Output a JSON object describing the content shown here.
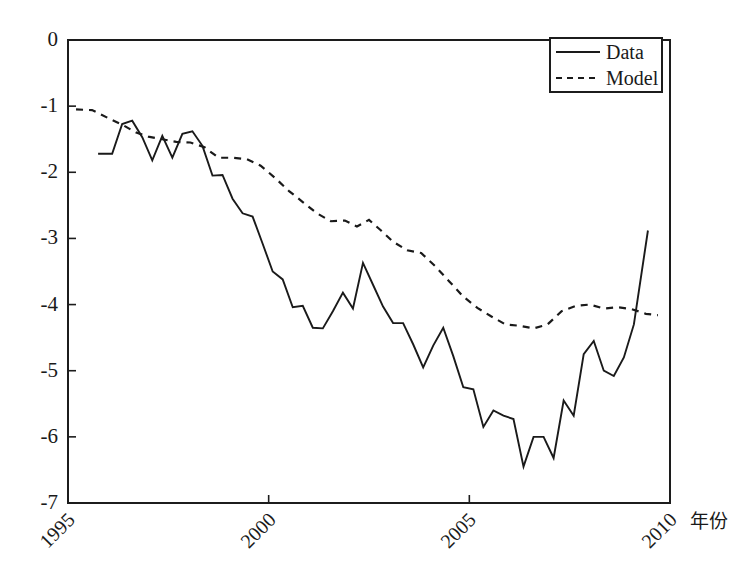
{
  "chart_data": {
    "type": "line",
    "title": "",
    "subtitle": "",
    "xlabel": "年份",
    "ylabel": "",
    "xlim": [
      1995,
      2010
    ],
    "ylim": [
      -7,
      0
    ],
    "grid": false,
    "legend_position": "top-right",
    "x_ticks": [
      1995,
      2000,
      2005,
      2010
    ],
    "x_tick_labels": [
      "1995",
      "2000",
      "2005",
      "2010"
    ],
    "y_ticks": [
      0,
      -1,
      -2,
      -3,
      -4,
      -5,
      -6,
      -7
    ],
    "y_tick_labels": [
      "0",
      "-1",
      "-2",
      "-3",
      "-4",
      "-5",
      "-6",
      "-7"
    ],
    "series": [
      {
        "name": "Data",
        "style": "solid",
        "color": "#1a1a1a",
        "x": [
          1995.75,
          1996.1,
          1996.35,
          1996.6,
          1996.85,
          1997.1,
          1997.35,
          1997.6,
          1997.85,
          1998.1,
          1998.35,
          1998.6,
          1998.85,
          1999.1,
          1999.35,
          1999.6,
          1999.85,
          2000.1,
          2000.35,
          2000.6,
          2000.85,
          2001.1,
          2001.35,
          2001.6,
          2001.85,
          2002.1,
          2002.35,
          2002.6,
          2002.85,
          2003.1,
          2003.35,
          2003.6,
          2003.85,
          2004.1,
          2004.35,
          2004.6,
          2004.85,
          2005.1,
          2005.35,
          2005.6,
          2005.85,
          2006.1,
          2006.35,
          2006.6,
          2006.85,
          2007.1,
          2007.35,
          2007.6,
          2007.85,
          2008.1,
          2008.35,
          2008.6,
          2008.85,
          2009.1,
          2009.45
        ],
        "y": [
          -1.72,
          -1.72,
          -1.27,
          -1.22,
          -1.47,
          -1.82,
          -1.45,
          -1.78,
          -1.42,
          -1.38,
          -1.6,
          -2.05,
          -2.04,
          -2.4,
          -2.62,
          -2.67,
          -3.08,
          -3.5,
          -3.62,
          -4.04,
          -4.02,
          -4.35,
          -4.36,
          -4.1,
          -3.82,
          -4.06,
          -3.37,
          -3.7,
          -4.03,
          -4.28,
          -4.28,
          -4.6,
          -4.95,
          -4.62,
          -4.35,
          -4.78,
          -5.25,
          -5.28,
          -5.85,
          -5.6,
          -5.68,
          -5.73,
          -6.45,
          -6.0,
          -6.0,
          -6.32,
          -5.45,
          -5.68,
          -4.75,
          -4.55,
          -5.0,
          -5.08,
          -4.8,
          -4.3,
          -2.88
        ]
      },
      {
        "name": "Model",
        "style": "dashed",
        "color": "#1a1a1a",
        "x": [
          1995.2,
          1995.6,
          1996.0,
          1996.35,
          1996.7,
          1997.0,
          1997.35,
          1997.7,
          1998.05,
          1998.4,
          1998.75,
          1999.1,
          1999.45,
          1999.8,
          2000.15,
          2000.5,
          2000.85,
          2001.2,
          2001.55,
          2001.9,
          2002.2,
          2002.5,
          2002.8,
          2003.1,
          2003.45,
          2003.8,
          2004.15,
          2004.5,
          2004.85,
          2005.2,
          2005.55,
          2005.9,
          2006.25,
          2006.6,
          2006.95,
          2007.3,
          2007.65,
          2008.0,
          2008.35,
          2008.7,
          2009.05,
          2009.4,
          2009.7
        ],
        "y": [
          -1.05,
          -1.06,
          -1.18,
          -1.28,
          -1.4,
          -1.46,
          -1.5,
          -1.54,
          -1.55,
          -1.62,
          -1.78,
          -1.78,
          -1.8,
          -1.9,
          -2.08,
          -2.28,
          -2.45,
          -2.62,
          -2.74,
          -2.73,
          -2.82,
          -2.72,
          -2.88,
          -3.05,
          -3.18,
          -3.22,
          -3.42,
          -3.65,
          -3.88,
          -4.05,
          -4.18,
          -4.3,
          -4.32,
          -4.36,
          -4.3,
          -4.1,
          -4.02,
          -4.0,
          -4.06,
          -4.04,
          -4.07,
          -4.14,
          -4.16
        ]
      }
    ],
    "legend": [
      {
        "label": "Data",
        "style": "solid"
      },
      {
        "label": "Model",
        "style": "dashed"
      }
    ]
  },
  "axes": {
    "xlabel": "年份"
  }
}
